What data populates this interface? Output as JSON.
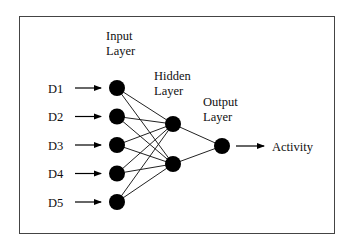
{
  "diagram": {
    "layer_labels": {
      "input": [
        "Input",
        "Layer"
      ],
      "hidden": [
        "Hidden",
        "Layer"
      ],
      "output": [
        "Output",
        "Layer"
      ]
    },
    "inputs": [
      "D1",
      "D2",
      "D3",
      "D4",
      "D5"
    ],
    "hidden_count": 2,
    "output_label": "Activity",
    "colors": {
      "node": "#000000",
      "line": "#222222",
      "border": "#444444"
    }
  }
}
